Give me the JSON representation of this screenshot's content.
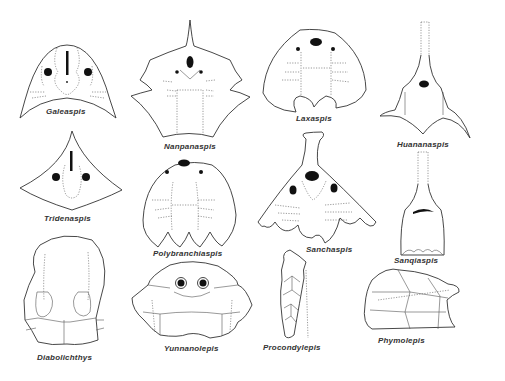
{
  "figure": {
    "panels": [
      {
        "id": "galeaspis",
        "label": "Galeaspis"
      },
      {
        "id": "nanpanaspis",
        "label": "Nanpanaspis"
      },
      {
        "id": "laxaspis",
        "label": "Laxaspis"
      },
      {
        "id": "huananaspis",
        "label": "Huananaspis"
      },
      {
        "id": "tridenaspis",
        "label": "Tridenaspis"
      },
      {
        "id": "polybranchiaspis",
        "label": "Polybranchiaspis"
      },
      {
        "id": "sanchaspis",
        "label": "Sanchaspis"
      },
      {
        "id": "sanqiaspis",
        "label": "Sanqiaspis"
      },
      {
        "id": "diabolichthys",
        "label": "Diabolichthys"
      },
      {
        "id": "yunnanolepis",
        "label": "Yunnanolepis"
      },
      {
        "id": "procondylepis",
        "label": "Procondylepis"
      },
      {
        "id": "phymolepis",
        "label": "Phymolepis"
      }
    ],
    "caption": ""
  }
}
